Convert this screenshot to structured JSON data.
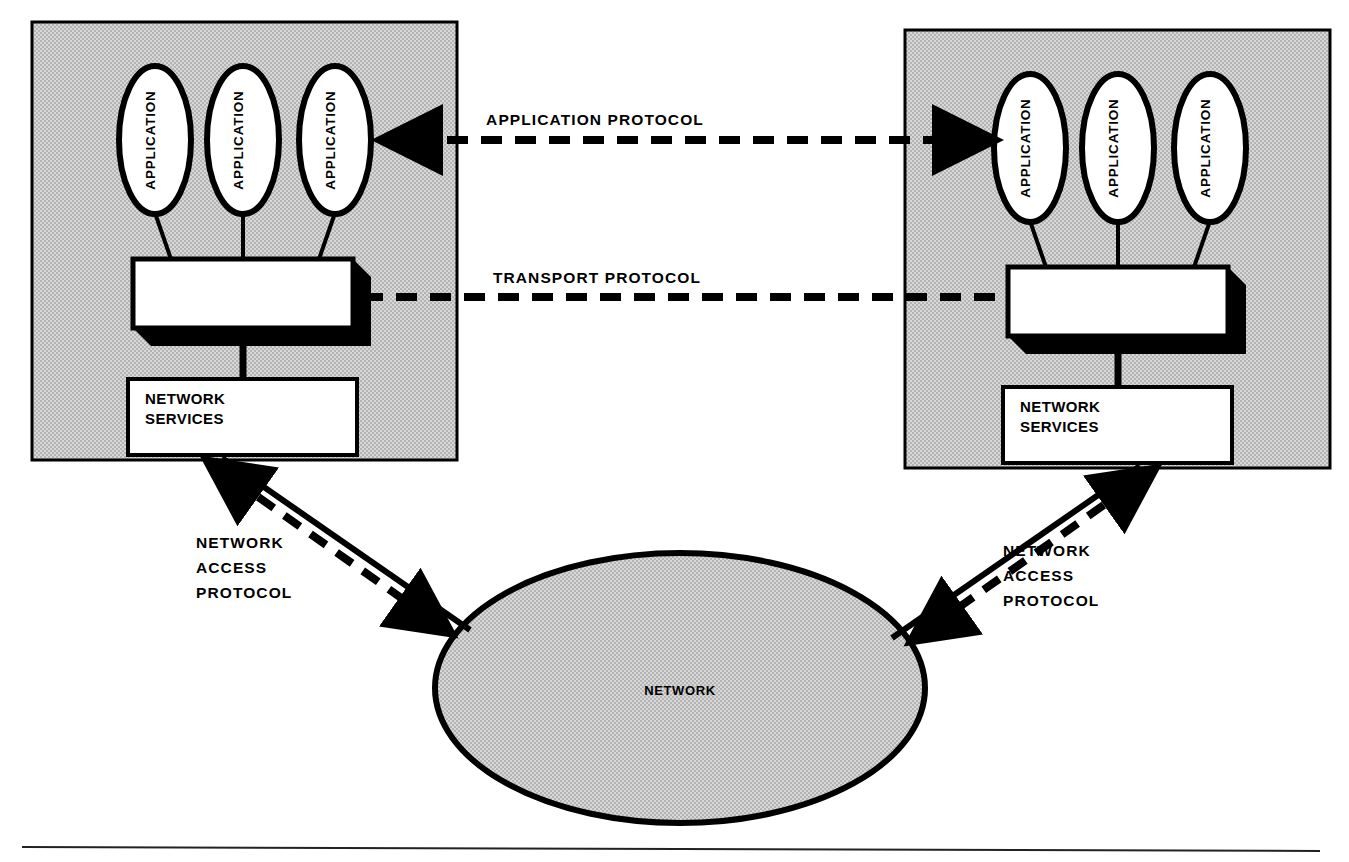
{
  "diagram": {
    "background_color": "#ffffff",
    "host_fill_color": "#c8c8c8",
    "cloud_fill_color": "#c8c8c8",
    "box_fill_color": "#ffffff",
    "stroke_color": "#000000"
  },
  "hosts": [
    {
      "id": "left-host",
      "applications": [
        {
          "label": "APPLICATION"
        },
        {
          "label": "APPLICATION"
        },
        {
          "label": "APPLICATION"
        }
      ],
      "transport_box": {
        "label": ""
      },
      "network_services_box": {
        "line1": "NETWORK",
        "line2": "SERVICES"
      }
    },
    {
      "id": "right-host",
      "applications": [
        {
          "label": "APPLICATION"
        },
        {
          "label": "APPLICATION"
        },
        {
          "label": "APPLICATION"
        }
      ],
      "transport_box": {
        "label": ""
      },
      "network_services_box": {
        "line1": "NETWORK",
        "line2": "SERVICES"
      }
    }
  ],
  "cloud": {
    "label": "NETWORK"
  },
  "protocols": {
    "application": {
      "label": "APPLICATION PROTOCOL",
      "style": "dashed",
      "arrows": "both"
    },
    "transport": {
      "label": "TRANSPORT PROTOCOL",
      "style": "dashed",
      "arrows": "none"
    },
    "network_access_left": {
      "line1": "NETWORK",
      "line2": "ACCESS",
      "line3": "PROTOCOL",
      "style": "dashed",
      "arrows": "both"
    },
    "network_access_right": {
      "line1": "NETWORK",
      "line2": "ACCESS",
      "line3": "PROTOCOL",
      "style": "dashed",
      "arrows": "both"
    }
  }
}
